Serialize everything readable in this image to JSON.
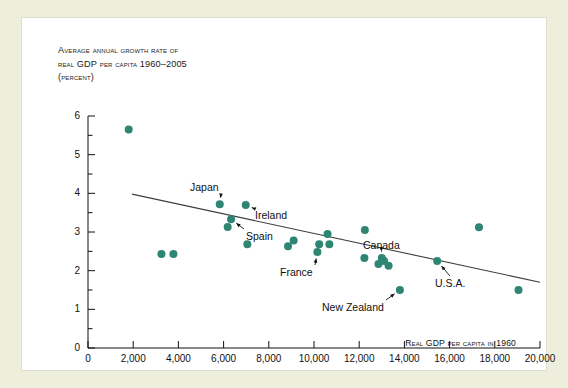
{
  "figure": {
    "title_lines": [
      "Average annual growth rate of",
      "real GDP per capita 1960–2005",
      "(percent)"
    ],
    "x_axis_title": "Real GDP per capita in 1960",
    "background_color": "#eeeedc",
    "card_color": "#ffffff",
    "marker_color": "#2e8574",
    "line_color": "#3d3d3d"
  },
  "chart_data": {
    "type": "scatter",
    "title": "Average annual growth rate of real GDP per capita 1960–2005 (percent)",
    "xlabel": "Real GDP per capita in 1960",
    "ylabel": "Average annual growth rate of real GDP per capita 1960-2005 (percent)",
    "xlim": [
      0,
      20000
    ],
    "ylim": [
      0,
      6
    ],
    "xticks": [
      0,
      2000,
      4000,
      6000,
      8000,
      10000,
      12000,
      14000,
      16000,
      18000,
      20000
    ],
    "xticklabels": [
      "0",
      "2,000",
      "4,000",
      "6,000",
      "8,000",
      "10,000",
      "12,000",
      "14,000",
      "16,000",
      "18,000",
      "20,000"
    ],
    "yticks": [
      0,
      1,
      2,
      3,
      4,
      5,
      6
    ],
    "yticklabels": [
      "0",
      "1",
      "2",
      "3",
      "4",
      "5",
      "6"
    ],
    "minor_y_ticks": [
      0.5,
      1.5,
      2.5,
      3.5,
      4.5,
      5.5
    ],
    "grid": false,
    "legend": null,
    "points": [
      {
        "x": 1800,
        "y": 5.65,
        "label": null
      },
      {
        "x": 3250,
        "y": 2.43,
        "label": null
      },
      {
        "x": 3780,
        "y": 2.43,
        "label": null
      },
      {
        "x": 5830,
        "y": 3.72,
        "label": "Japan"
      },
      {
        "x": 6180,
        "y": 3.13,
        "label": null
      },
      {
        "x": 6330,
        "y": 3.33,
        "label": "Spain"
      },
      {
        "x": 6980,
        "y": 3.7,
        "label": "Ireland"
      },
      {
        "x": 7050,
        "y": 2.68,
        "label": null
      },
      {
        "x": 8850,
        "y": 2.63,
        "label": null
      },
      {
        "x": 9100,
        "y": 2.78,
        "label": null
      },
      {
        "x": 10150,
        "y": 2.48,
        "label": "France"
      },
      {
        "x": 10230,
        "y": 2.68,
        "label": null
      },
      {
        "x": 10600,
        "y": 2.95,
        "label": null
      },
      {
        "x": 10680,
        "y": 2.68,
        "label": null
      },
      {
        "x": 12250,
        "y": 3.05,
        "label": null
      },
      {
        "x": 12230,
        "y": 2.33,
        "label": null
      },
      {
        "x": 12850,
        "y": 2.17,
        "label": null
      },
      {
        "x": 13000,
        "y": 2.33,
        "label": "Canada"
      },
      {
        "x": 13100,
        "y": 2.25,
        "label": null
      },
      {
        "x": 13300,
        "y": 2.13,
        "label": null
      },
      {
        "x": 13800,
        "y": 1.5,
        "label": "New Zealand"
      },
      {
        "x": 15450,
        "y": 2.25,
        "label": "U.S.A."
      },
      {
        "x": 17300,
        "y": 3.12,
        "label": null
      },
      {
        "x": 19050,
        "y": 1.5,
        "label": null
      }
    ],
    "trend_line": {
      "x1": 1950,
      "y1": 3.98,
      "x2": 20000,
      "y2": 1.7
    }
  },
  "annotations": [
    {
      "name": "japan",
      "text": "Japan"
    },
    {
      "name": "ireland",
      "text": "Ireland"
    },
    {
      "name": "spain",
      "text": "Spain"
    },
    {
      "name": "france",
      "text": "France"
    },
    {
      "name": "canada",
      "text": "Canada"
    },
    {
      "name": "new-zealand",
      "text": "New Zealand"
    },
    {
      "name": "usa",
      "text": "U.S.A."
    }
  ]
}
